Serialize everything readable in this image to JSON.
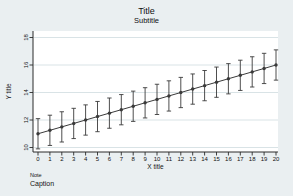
{
  "chart_data": {
    "type": "line",
    "title": "Title",
    "subtitle": "Subtitle",
    "xlabel": "X title",
    "ylabel": "Y title",
    "note": "Note",
    "caption": "Caption",
    "legend": "none",
    "grid": true,
    "x": [
      0,
      1,
      2,
      3,
      4,
      5,
      6,
      7,
      8,
      9,
      10,
      11,
      12,
      13,
      14,
      15,
      16,
      17,
      18,
      19,
      20
    ],
    "values": [
      11.0,
      11.25,
      11.5,
      11.75,
      12.0,
      12.25,
      12.5,
      12.75,
      13.0,
      13.25,
      13.5,
      13.75,
      14.0,
      14.25,
      14.5,
      14.75,
      15.0,
      15.25,
      15.5,
      15.75,
      16.0
    ],
    "ci_low": [
      9.9,
      10.15,
      10.4,
      10.65,
      10.9,
      11.15,
      11.4,
      11.65,
      11.9,
      12.15,
      12.4,
      12.65,
      12.9,
      13.15,
      13.4,
      13.65,
      13.9,
      14.15,
      14.4,
      14.65,
      14.9
    ],
    "ci_high": [
      12.1,
      12.35,
      12.6,
      12.85,
      13.1,
      13.35,
      13.6,
      13.85,
      14.1,
      14.35,
      14.6,
      14.85,
      15.1,
      15.35,
      15.6,
      15.85,
      16.1,
      16.35,
      16.6,
      16.85,
      17.1
    ],
    "x_ticks": [
      0,
      1,
      2,
      3,
      4,
      5,
      6,
      7,
      8,
      9,
      10,
      11,
      12,
      13,
      14,
      15,
      16,
      17,
      18,
      19,
      20
    ],
    "y_ticks": [
      10,
      12,
      14,
      16,
      18
    ],
    "xlim": [
      -0.4,
      20.2
    ],
    "ylim": [
      9.7,
      18.5
    ],
    "colors": {
      "background": "#eaeff1",
      "plot_background": "#ffffff",
      "grid": "#d9e3e6",
      "axis": "#2b2b2b",
      "series": "#3a3a3a",
      "text": "#111111"
    }
  }
}
